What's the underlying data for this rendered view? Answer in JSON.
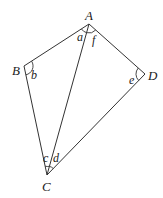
{
  "diagram": {
    "type": "quadrilateral-with-diagonal",
    "vertices": [
      {
        "id": "A",
        "label": "A",
        "x": 89,
        "y": 24
      },
      {
        "id": "B",
        "label": "B",
        "x": 24,
        "y": 66
      },
      {
        "id": "C",
        "label": "C",
        "x": 47,
        "y": 175
      },
      {
        "id": "D",
        "label": "D",
        "x": 145,
        "y": 74
      }
    ],
    "edges": [
      [
        "A",
        "B"
      ],
      [
        "B",
        "C"
      ],
      [
        "C",
        "D"
      ],
      [
        "D",
        "A"
      ],
      [
        "A",
        "C"
      ]
    ],
    "angles": [
      {
        "label": "a",
        "at": "A",
        "between": [
          "B",
          "C"
        ]
      },
      {
        "label": "f",
        "at": "A",
        "between": [
          "C",
          "D"
        ]
      },
      {
        "label": "b",
        "at": "B",
        "between": [
          "A",
          "C"
        ]
      },
      {
        "label": "c",
        "at": "C",
        "between": [
          "B",
          "A"
        ]
      },
      {
        "label": "d",
        "at": "C",
        "between": [
          "A",
          "D"
        ]
      },
      {
        "label": "e",
        "at": "D",
        "between": [
          "A",
          "C"
        ]
      }
    ]
  },
  "labels": {
    "A": "A",
    "B": "B",
    "C": "C",
    "D": "D",
    "a": "a",
    "b": "b",
    "c": "c",
    "d": "d",
    "e": "e",
    "f": "f"
  },
  "colors": {
    "stroke": "#333333",
    "text": "#222222",
    "background": "#ffffff"
  }
}
